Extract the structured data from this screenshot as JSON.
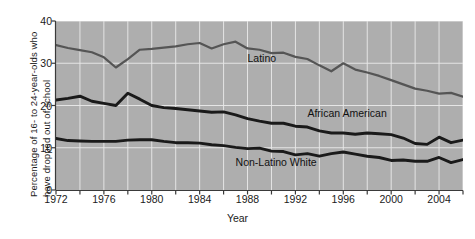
{
  "chart_data": {
    "type": "line",
    "title": "",
    "xlabel": "Year",
    "ylabel": "Percentage of 16- to 24-year-olds who\nhave dropped out of school",
    "xlim": [
      1972,
      2006
    ],
    "ylim": [
      0,
      40
    ],
    "yticks": [
      0,
      10,
      20,
      30,
      40
    ],
    "xticks": [
      1972,
      1974,
      1976,
      1978,
      1980,
      1982,
      1984,
      1986,
      1988,
      1990,
      1992,
      1994,
      1996,
      1998,
      2000,
      2002,
      2004,
      2006
    ],
    "xtick_labels": [
      1972,
      1976,
      1980,
      1984,
      1988,
      1992,
      1996,
      2000,
      2004
    ],
    "grid": true,
    "grid_color": "#e8e8e8",
    "plot_background": "#aeaeae",
    "legend_position": "inline-labels",
    "x": [
      1972,
      1973,
      1974,
      1975,
      1976,
      1977,
      1978,
      1979,
      1980,
      1981,
      1982,
      1983,
      1984,
      1985,
      1986,
      1987,
      1988,
      1989,
      1990,
      1991,
      1992,
      1993,
      1994,
      1995,
      1996,
      1997,
      1998,
      1999,
      2000,
      2001,
      2002,
      2003,
      2004,
      2005,
      2006
    ],
    "series": [
      {
        "name": "Latino",
        "color": "#555555",
        "values": [
          34.3,
          33.6,
          33.1,
          32.6,
          31.4,
          29.0,
          31.0,
          33.2,
          33.4,
          33.7,
          34.0,
          34.5,
          34.8,
          33.5,
          34.5,
          35.1,
          33.5,
          33.2,
          32.4,
          32.5,
          31.5,
          31.0,
          29.5,
          28.1,
          30.0,
          28.5,
          27.8,
          27.0,
          26.0,
          25.0,
          24.0,
          23.5,
          22.8,
          23.0,
          22.1
        ]
      },
      {
        "name": "African American",
        "color": "#1a1a1a",
        "values": [
          21.3,
          21.7,
          22.2,
          21.0,
          20.5,
          20.0,
          22.9,
          21.5,
          20.0,
          19.5,
          19.3,
          19.0,
          18.7,
          18.4,
          18.5,
          17.8,
          16.9,
          16.3,
          15.8,
          15.8,
          15.1,
          14.9,
          14.0,
          13.5,
          13.5,
          13.2,
          13.5,
          13.3,
          13.1,
          12.3,
          11.0,
          10.8,
          12.5,
          11.2,
          11.8
        ]
      },
      {
        "name": "Non-Latino White",
        "color": "#1a1a1a",
        "values": [
          12.2,
          11.7,
          11.6,
          11.5,
          11.5,
          11.5,
          11.8,
          11.9,
          11.9,
          11.5,
          11.2,
          11.2,
          11.1,
          10.7,
          10.5,
          10.1,
          9.8,
          9.9,
          9.2,
          9.1,
          8.3,
          8.6,
          8.0,
          8.6,
          9.0,
          8.5,
          8.0,
          7.7,
          7.0,
          7.1,
          6.8,
          6.8,
          7.7,
          6.5,
          7.2
        ]
      }
    ],
    "annotations": [
      {
        "text": "Latino",
        "x": 1988.0,
        "y": 31.0
      },
      {
        "text": "African American",
        "x": 1993.0,
        "y": 18.0
      },
      {
        "text": "Non-Latino White",
        "x": 1987.0,
        "y": 6.5
      }
    ]
  },
  "axis": {
    "ylabel_text": "Percentage of 16- to 24-year-olds who\nhave dropped out of school",
    "xlabel_text": "Year"
  }
}
